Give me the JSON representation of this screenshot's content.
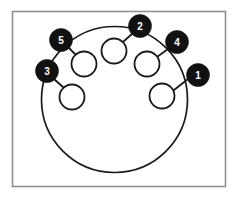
{
  "figure": {
    "frame": {
      "x": 12.5,
      "y": 11.5,
      "width": 213,
      "height": 175,
      "stroke_color": "#8d8f94"
    },
    "shell": {
      "label": "connector-shell-outline",
      "cx": 114.5,
      "cy": 99.5,
      "r": 73,
      "stroke_color": "#1a1a1a"
    },
    "badge_fill_color": "#111111",
    "badge_text_color": "#ffffff",
    "pin_fill_color": "#ffffff",
    "pin_stroke_color": "#1a1a1a"
  },
  "chart_data": {
    "type": "scatter",
    "xlabel": "",
    "ylabel": "",
    "pins": [
      {
        "number": "1",
        "pin_cx": 162,
        "pin_cy": 96,
        "pin_r": 12.5,
        "badge_cx": 198,
        "badge_cy": 75,
        "badge_r": 11.5,
        "leader": [
          174,
          90,
          188,
          79
        ]
      },
      {
        "number": "2",
        "pin_cx": 114,
        "pin_cy": 51,
        "pin_r": 12.5,
        "badge_cx": 140,
        "badge_cy": 26,
        "badge_r": 11.5,
        "leader": [
          123,
          42,
          133,
          33
        ]
      },
      {
        "number": "3",
        "pin_cx": 72,
        "pin_cy": 97,
        "pin_r": 12.5,
        "badge_cx": 47,
        "badge_cy": 71,
        "badge_r": 11.5,
        "leader": [
          64,
          88,
          54,
          79
        ]
      },
      {
        "number": "4",
        "pin_cx": 147,
        "pin_cy": 64,
        "pin_r": 12.5,
        "badge_cx": 177,
        "badge_cy": 42,
        "badge_r": 11.5,
        "leader": [
          157,
          57,
          168,
          49
        ]
      },
      {
        "number": "5",
        "pin_cx": 84,
        "pin_cy": 64,
        "pin_r": 12.5,
        "badge_cx": 61,
        "badge_cy": 40,
        "badge_r": 11.5,
        "leader": [
          76,
          55,
          68,
          47
        ]
      }
    ],
    "legend_position": "none",
    "grid": false
  }
}
